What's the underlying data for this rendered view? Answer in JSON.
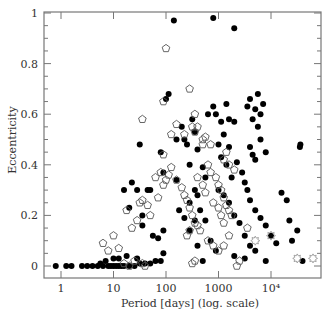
{
  "chart_data": {
    "type": "scatter",
    "title": "",
    "xlabel": "Period [days] (log. scale)",
    "ylabel": "Eccentricity",
    "xscale": "log",
    "xlim": [
      0.48,
      87000
    ],
    "ylim": [
      -0.047,
      1.0
    ],
    "grid": false,
    "legend": null,
    "x_ticks": [
      {
        "value": 1,
        "label": "1"
      },
      {
        "value": 10,
        "label": "10"
      },
      {
        "value": 100,
        "label": "100"
      },
      {
        "value": 1000,
        "label": "1000"
      },
      {
        "value": 10000,
        "label": "10⁴"
      }
    ],
    "y_ticks": [
      {
        "value": 0,
        "label": "0"
      },
      {
        "value": 0.2,
        "label": "0.2"
      },
      {
        "value": 0.4,
        "label": "0.4"
      },
      {
        "value": 0.6,
        "label": "0.6"
      },
      {
        "value": 0.8,
        "label": "0.8"
      },
      {
        "value": 1,
        "label": "1"
      }
    ],
    "series": [
      {
        "name": "filled-circles",
        "marker": "filled-circle",
        "color": "#000000",
        "points_log10P_e": [
          [
            -0.1,
            0.0
          ],
          [
            0.1,
            0.0
          ],
          [
            0.2,
            0.0
          ],
          [
            0.4,
            0.0
          ],
          [
            0.5,
            0.0
          ],
          [
            0.6,
            0.0
          ],
          [
            0.7,
            0.0
          ],
          [
            0.8,
            0.0
          ],
          [
            0.9,
            0.0
          ],
          [
            0.95,
            0.0
          ],
          [
            1.0,
            0.0
          ],
          [
            1.05,
            0.0
          ],
          [
            1.1,
            0.0
          ],
          [
            1.15,
            0.0
          ],
          [
            1.2,
            0.0
          ],
          [
            1.3,
            0.0
          ],
          [
            1.4,
            0.0
          ],
          [
            1.5,
            0.01
          ],
          [
            1.6,
            0.01
          ],
          [
            1.7,
            0.01
          ],
          [
            1.8,
            0.02
          ],
          [
            1.9,
            0.02
          ],
          [
            1.95,
            0.05
          ],
          [
            0.75,
            0.01
          ],
          [
            0.85,
            0.02
          ],
          [
            1.0,
            0.03
          ],
          [
            1.1,
            0.03
          ],
          [
            1.25,
            0.04
          ],
          [
            1.45,
            0.03
          ],
          [
            1.2,
            0.3
          ],
          [
            1.5,
            0.48
          ],
          [
            1.55,
            0.2
          ],
          [
            1.65,
            0.3
          ],
          [
            1.7,
            0.3
          ],
          [
            1.75,
            0.12
          ],
          [
            1.9,
            0.45
          ],
          [
            1.95,
            0.37
          ],
          [
            1.3,
            0.23
          ],
          [
            1.35,
            0.33
          ],
          [
            1.45,
            0.3
          ],
          [
            1.55,
            0.16
          ],
          [
            1.85,
            0.11
          ],
          [
            1.95,
            0.14
          ],
          [
            2.0,
            0.66
          ],
          [
            2.15,
            0.97
          ],
          [
            2.35,
            0.5
          ],
          [
            2.45,
            0.25
          ],
          [
            2.5,
            0.58
          ],
          [
            2.55,
            0.53
          ],
          [
            2.6,
            0.46
          ],
          [
            2.7,
            0.39
          ],
          [
            2.8,
            0.6
          ],
          [
            2.9,
            0.63
          ],
          [
            2.05,
            0.68
          ],
          [
            2.2,
            0.5
          ],
          [
            2.3,
            0.55
          ],
          [
            2.4,
            0.48
          ],
          [
            2.45,
            0.4
          ],
          [
            2.55,
            0.3
          ],
          [
            2.6,
            0.28
          ],
          [
            2.65,
            0.22
          ],
          [
            2.75,
            0.18
          ],
          [
            2.85,
            0.1
          ],
          [
            2.95,
            0.06
          ],
          [
            2.2,
            0.34
          ],
          [
            2.25,
            0.22
          ],
          [
            2.35,
            0.19
          ],
          [
            2.45,
            0.14
          ],
          [
            2.55,
            0.18
          ],
          [
            2.6,
            0.08
          ],
          [
            2.7,
            0.02
          ],
          [
            2.75,
            0.35
          ],
          [
            2.9,
            0.98
          ],
          [
            3.3,
            0.94
          ],
          [
            2.95,
            0.6
          ],
          [
            3.05,
            0.57
          ],
          [
            3.1,
            0.52
          ],
          [
            3.15,
            0.64
          ],
          [
            3.2,
            0.58
          ],
          [
            3.3,
            0.57
          ],
          [
            3.0,
            0.48
          ],
          [
            3.05,
            0.43
          ],
          [
            3.15,
            0.4
          ],
          [
            3.2,
            0.47
          ],
          [
            3.25,
            0.35
          ],
          [
            3.35,
            0.41
          ],
          [
            3.45,
            0.37
          ],
          [
            3.5,
            0.33
          ],
          [
            3.55,
            0.3
          ],
          [
            3.6,
            0.47
          ],
          [
            3.65,
            0.44
          ],
          [
            3.7,
            0.42
          ],
          [
            3.75,
            0.55
          ],
          [
            3.8,
            0.5
          ],
          [
            3.9,
            0.45
          ],
          [
            3.0,
            0.3
          ],
          [
            3.1,
            0.28
          ],
          [
            3.2,
            0.25
          ],
          [
            3.3,
            0.2
          ],
          [
            3.4,
            0.17
          ],
          [
            3.5,
            0.12
          ],
          [
            3.6,
            0.08
          ],
          [
            3.7,
            0.06
          ],
          [
            3.55,
            0.63
          ],
          [
            3.6,
            0.66
          ],
          [
            3.65,
            0.58
          ],
          [
            3.7,
            0.62
          ],
          [
            3.75,
            0.68
          ],
          [
            3.8,
            0.6
          ],
          [
            3.85,
            0.64
          ],
          [
            3.6,
            0.26
          ],
          [
            3.7,
            0.22
          ],
          [
            3.8,
            0.19
          ],
          [
            3.9,
            0.16
          ],
          [
            4.0,
            0.12
          ],
          [
            4.1,
            0.09
          ],
          [
            4.2,
            0.29
          ],
          [
            4.3,
            0.26
          ],
          [
            4.55,
            0.47
          ],
          [
            4.56,
            0.48
          ],
          [
            4.35,
            0.18
          ],
          [
            4.5,
            0.14
          ],
          [
            4.4,
            0.1
          ],
          [
            3.3,
            0.04
          ],
          [
            3.5,
            0.03
          ],
          [
            3.9,
            0.02
          ],
          [
            4.6,
            0.02
          ]
        ]
      },
      {
        "name": "open-pentagons",
        "marker": "open-pentagon",
        "color": "#555555",
        "points_log10P_e": [
          [
            0.8,
            0.09
          ],
          [
            0.9,
            0.06
          ],
          [
            1.0,
            0.12
          ],
          [
            1.1,
            0.07
          ],
          [
            1.2,
            0.01
          ],
          [
            1.3,
            0.0
          ],
          [
            1.4,
            0.02
          ],
          [
            1.55,
            0.01
          ],
          [
            1.6,
            0.0
          ],
          [
            1.35,
            0.15
          ],
          [
            1.45,
            0.18
          ],
          [
            1.25,
            0.22
          ],
          [
            1.5,
            0.25
          ],
          [
            1.55,
            0.26
          ],
          [
            1.65,
            0.24
          ],
          [
            1.7,
            0.2
          ],
          [
            1.85,
            0.27
          ],
          [
            1.95,
            0.32
          ],
          [
            1.8,
            0.35
          ],
          [
            1.9,
            0.37
          ],
          [
            1.95,
            0.44
          ],
          [
            2.0,
            0.34
          ],
          [
            2.05,
            0.36
          ],
          [
            2.1,
            0.39
          ],
          [
            2.2,
            0.34
          ],
          [
            2.3,
            0.31
          ],
          [
            2.35,
            0.28
          ],
          [
            2.4,
            0.26
          ],
          [
            2.45,
            0.23
          ],
          [
            2.5,
            0.2
          ],
          [
            2.55,
            0.17
          ],
          [
            2.6,
            0.16
          ],
          [
            2.65,
            0.14
          ],
          [
            2.1,
            0.52
          ],
          [
            2.2,
            0.56
          ],
          [
            2.35,
            0.52
          ],
          [
            2.45,
            0.7
          ],
          [
            2.55,
            0.6
          ],
          [
            2.6,
            0.55
          ],
          [
            2.7,
            0.48
          ],
          [
            1.55,
            0.58
          ],
          [
            1.95,
            0.65
          ],
          [
            2.0,
            0.86
          ],
          [
            2.8,
            0.4
          ],
          [
            2.85,
            0.37
          ],
          [
            2.95,
            0.35
          ],
          [
            3.0,
            0.32
          ],
          [
            3.05,
            0.3
          ],
          [
            3.1,
            0.27
          ],
          [
            3.15,
            0.24
          ],
          [
            3.2,
            0.22
          ],
          [
            3.25,
            0.2
          ],
          [
            2.6,
            0.35
          ],
          [
            2.7,
            0.32
          ],
          [
            2.75,
            0.29
          ],
          [
            2.9,
            0.25
          ],
          [
            3.0,
            0.23
          ],
          [
            3.05,
            0.2
          ],
          [
            3.1,
            0.17
          ],
          [
            3.2,
            0.12
          ],
          [
            2.8,
            0.1
          ],
          [
            2.9,
            0.08
          ],
          [
            3.0,
            0.06
          ],
          [
            3.1,
            0.08
          ],
          [
            3.4,
            0.02
          ],
          [
            3.55,
            0.15
          ],
          [
            3.35,
            0.0
          ],
          [
            2.5,
            0.55
          ],
          [
            2.55,
            0.53
          ],
          [
            2.7,
            0.5
          ],
          [
            2.75,
            0.51
          ],
          [
            2.85,
            0.48
          ],
          [
            3.1,
            0.42
          ],
          [
            3.15,
            0.45
          ],
          [
            3.2,
            0.4
          ],
          [
            3.3,
            0.38
          ],
          [
            2.4,
            0.12
          ],
          [
            2.45,
            0.14
          ],
          [
            2.5,
            0.01
          ],
          [
            2.55,
            0.02
          ]
        ]
      },
      {
        "name": "open-stars",
        "marker": "open-star",
        "color": "#999999",
        "points_log10P_e": [
          [
            3.7,
            0.1
          ],
          [
            4.0,
            0.12
          ],
          [
            4.5,
            0.03
          ],
          [
            4.8,
            0.03
          ]
        ]
      }
    ]
  },
  "axes": {
    "xlabel": "Period [days] (log. scale)",
    "ylabel": "Eccentricity"
  }
}
